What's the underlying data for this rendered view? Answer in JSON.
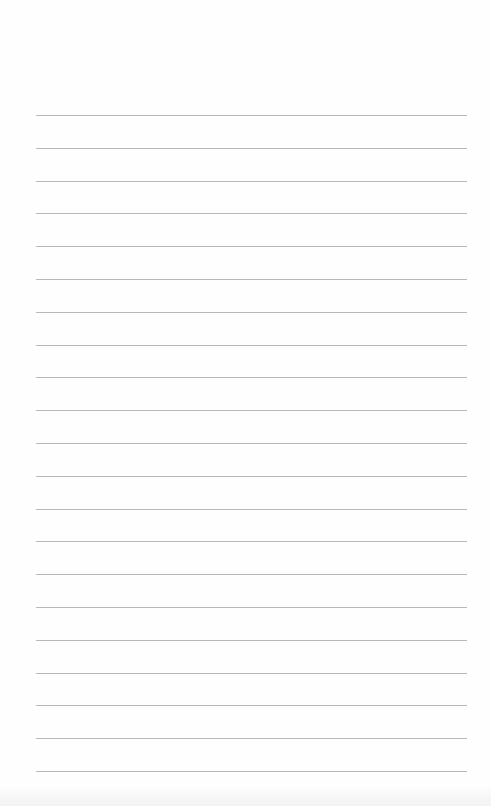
{
  "page": {
    "type": "blank lined paper",
    "background_color": "#fefefe",
    "rule_color": "#b9b9b9",
    "rule_count": 21,
    "first_rule_y": 115,
    "rule_spacing": 32.8,
    "rule_left": 36,
    "rule_right": 467
  }
}
